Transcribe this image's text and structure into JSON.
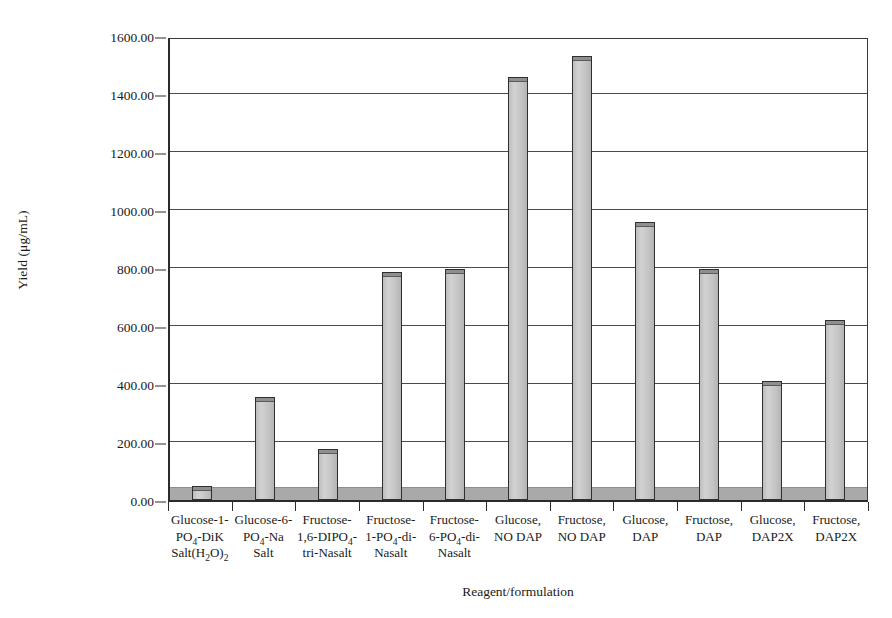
{
  "chart_data": {
    "type": "bar",
    "title": "",
    "xlabel": "Reagent/formulation",
    "ylabel": "Yield (μg/mL)",
    "ylim": [
      0,
      1600
    ],
    "ytick_step": 200,
    "ytick_labels": [
      "1600.00",
      "1400.00",
      "1200.00",
      "1000.00",
      "800.00",
      "600.00",
      "400.00",
      "200.00",
      "0.00"
    ],
    "ytick_values": [
      1600,
      1400,
      1200,
      1000,
      800,
      600,
      400,
      200,
      0
    ],
    "grid": "horizontal",
    "legend": "none",
    "bar_fill_color": "#c9c9c9",
    "bar_border_color": "#2f2f2f",
    "floor_band_color": "#a9a9a9",
    "floor_band_value": 40,
    "categories": [
      "Glucose-1-PO4-DiK Salt(H2O)2",
      "Glucose-6-PO4-Na Salt",
      "Fructose-1,6-DIPO4-tri-Nasalt",
      "Fructose-1-PO4-di-Nasalt",
      "Fructose-6-PO4-di-Nasalt",
      "Glucose, NO DAP",
      "Fructose, NO DAP",
      "Glucose, DAP",
      "Fructose, DAP",
      "Glucose, DAP2X",
      "Fructose, DAP2X"
    ],
    "values": [
      50,
      355,
      175,
      785,
      795,
      1460,
      1530,
      960,
      795,
      410,
      620
    ]
  },
  "axis": {
    "x_title": "Reagent/formulation",
    "y_title": "Yield (μg/mL)"
  },
  "categories_html": [
    "Glucose-1-<br>PO<sub>4</sub>-DiK<br>Salt(H<sub>2</sub>O)<sub>2</sub>",
    "Glucose-6-<br>PO<sub>4</sub>-Na<br>Salt",
    "Fructose-<br>1,6-DIPO<sub>4</sub>-<br>tri-Nasalt",
    "Fructose-<br>1-PO<sub>4</sub>-di-<br>Nasalt",
    "Fructose-<br>6-PO<sub>4</sub>-di-<br>Nasalt",
    "Glucose,<br>NO DAP",
    "Fructose,<br>NO DAP",
    "Glucose,<br>DAP",
    "Fructose,<br>DAP",
    "Glucose,<br>DAP2X",
    "Fructose,<br>DAP2X"
  ]
}
